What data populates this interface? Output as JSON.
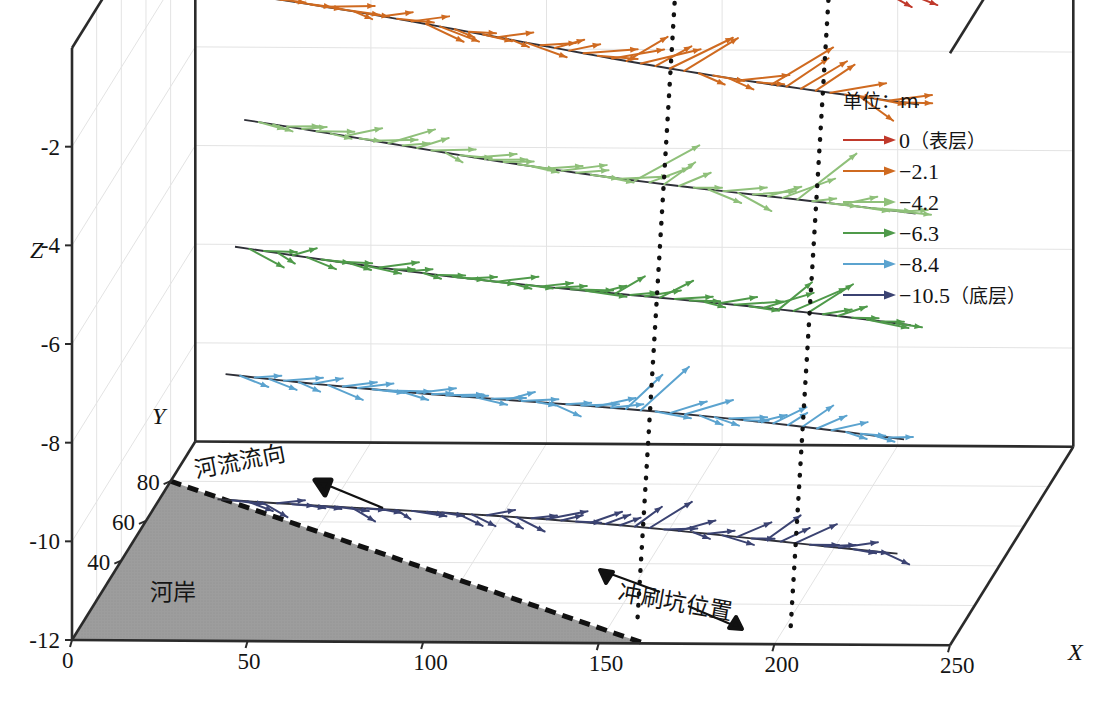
{
  "figure": {
    "kind": "3d-quiver-vector-field",
    "background": "#ffffff"
  },
  "axes": {
    "x": {
      "name": "X",
      "ticks": [
        "0",
        "50",
        "100",
        "150",
        "200",
        "250"
      ],
      "values": [
        0,
        50,
        100,
        150,
        200,
        250
      ],
      "range": [
        0,
        250
      ]
    },
    "y": {
      "name": "Y",
      "ticks": [
        "40",
        "60",
        "80"
      ],
      "values": [
        40,
        60,
        80
      ],
      "range": [
        0,
        100
      ]
    },
    "z": {
      "name": "Z",
      "ticks": [
        "-2",
        "-4",
        "-6",
        "-8",
        "-10",
        "-12"
      ],
      "values": [
        -2,
        -4,
        -6,
        -8,
        -10,
        -12
      ],
      "range": [
        -12,
        0
      ]
    }
  },
  "legend": {
    "title": "单位：m",
    "entries": [
      {
        "label": "0（表层）",
        "depth": 0,
        "color": "#c0392b"
      },
      {
        "label": "−2.1",
        "depth": -2.1,
        "color": "#cf6a20"
      },
      {
        "label": "−4.2",
        "depth": -4.2,
        "color": "#8fc07a"
      },
      {
        "label": "−6.3",
        "depth": -6.3,
        "color": "#4f9a4a"
      },
      {
        "label": "−8.4",
        "depth": -8.4,
        "color": "#5ba3cf"
      },
      {
        "label": "−10.5（底层）",
        "depth": -10.5,
        "color": "#3b4372"
      }
    ]
  },
  "annotations": {
    "flow_direction": "河流流向",
    "bank": "河岸",
    "scour_pit": "冲刷坑位置"
  },
  "chart_data": {
    "type": "scatter",
    "title": "",
    "xlabel": "X",
    "ylabel": "Y",
    "zlabel": "Z",
    "xlim": [
      0,
      250
    ],
    "ylim": [
      0,
      100
    ],
    "zlim": [
      -12,
      0
    ],
    "grid": true,
    "legend_position": "top-right",
    "series": [
      {
        "name": "0（表层）",
        "depth": 0,
        "color": "#c0392b"
      },
      {
        "name": "−2.1",
        "depth": -2.1,
        "color": "#cf6a20"
      },
      {
        "name": "−4.2",
        "depth": -4.2,
        "color": "#8fc07a"
      },
      {
        "name": "−6.3",
        "depth": -6.3,
        "color": "#4f9a4a"
      },
      {
        "name": "−8.4",
        "depth": -8.4,
        "color": "#5ba3cf"
      },
      {
        "name": "−10.5（底层）",
        "depth": -10.5,
        "color": "#3b4372"
      }
    ],
    "scour_pit_x": [
      150,
      195
    ],
    "bank_polygon_y": 80
  }
}
